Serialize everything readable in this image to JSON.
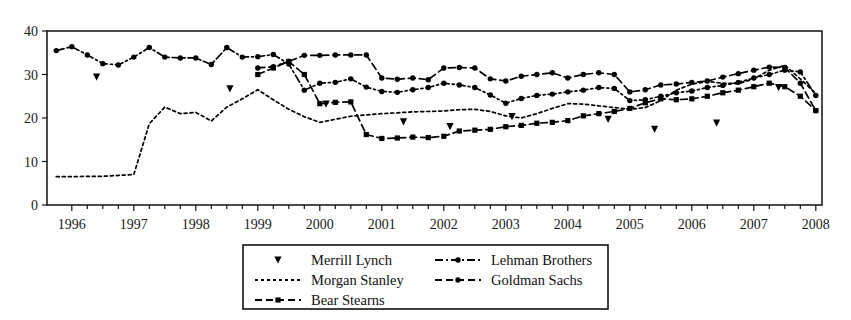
{
  "chart_data": {
    "type": "line",
    "title": "",
    "subtitle": "",
    "xlabel": "",
    "ylabel": "",
    "xlim": [
      1995.6,
      2008.1
    ],
    "ylim": [
      0,
      40
    ],
    "ytick_labels": [
      "0",
      "10",
      "20",
      "30",
      "40"
    ],
    "ytick_values": [
      0,
      10,
      20,
      30,
      40
    ],
    "xtick_labels": [
      "1996",
      "1997",
      "1998",
      "1999",
      "2000",
      "2001",
      "2002",
      "2003",
      "2004",
      "2005",
      "2006",
      "2007",
      "2008"
    ],
    "xtick_values": [
      1996,
      1997,
      1998,
      1999,
      2000,
      2001,
      2002,
      2003,
      2004,
      2005,
      2006,
      2007,
      2008
    ],
    "minor_xticks_per_year": 4,
    "grid": false,
    "legend_position": "below-center",
    "frame": true,
    "series": [
      {
        "name": "Merrill Lynch",
        "style": "markers-only",
        "marker": "triangle-down",
        "x": [
          1996.4,
          1998.55,
          2000.1,
          2001.35,
          2002.1,
          2003.1,
          2004.65,
          2005.4,
          2006.4,
          2007.4
        ],
        "values": [
          29.4,
          26.7,
          23.2,
          19.1,
          18.0,
          20.3,
          19.7,
          17.4,
          18.8,
          27.0
        ]
      },
      {
        "name": "Morgan Stanley",
        "style": "dotted",
        "marker": "none",
        "x": [
          1995.75,
          1996.0,
          1996.25,
          1996.5,
          1996.75,
          1997.0,
          1997.25,
          1997.5,
          1997.75,
          1998.0,
          1998.25,
          1998.5,
          1998.75,
          1999.0,
          1999.25,
          1999.5,
          1999.75,
          2000.0,
          2000.25,
          2000.5,
          2000.75,
          2001.0,
          2001.25,
          2001.5,
          2001.75,
          2002.0,
          2002.25,
          2002.5,
          2002.75,
          2003.0,
          2003.25,
          2003.5,
          2003.75,
          2004.0,
          2004.25,
          2004.5,
          2004.75,
          2005.0,
          2005.25,
          2005.5,
          2005.75,
          2006.0,
          2006.25,
          2006.5,
          2006.75,
          2007.0,
          2007.25,
          2007.5,
          2007.75,
          2008.0
        ],
        "values": [
          6.5,
          6.5,
          6.6,
          6.6,
          6.8,
          7.0,
          18.7,
          22.5,
          21.0,
          21.3,
          19.3,
          22.5,
          24.4,
          26.5,
          24.2,
          22.0,
          20.3,
          19.0,
          19.7,
          20.4,
          20.7,
          21.0,
          21.2,
          21.4,
          21.5,
          21.6,
          21.9,
          22.0,
          21.5,
          20.5,
          20.0,
          21.0,
          22.2,
          23.3,
          23.2,
          22.8,
          22.4,
          22.0,
          22.4,
          24.0,
          26.4,
          27.8,
          28.4,
          28.0,
          27.9,
          29.0,
          31.0,
          32.1,
          29.0,
          25.6
        ]
      },
      {
        "name": "Bear Stearns",
        "style": "dashed",
        "marker": "square",
        "x": [
          1999.0,
          1999.25,
          1999.5,
          1999.75,
          2000.0,
          2000.25,
          2000.5,
          2000.75,
          2001.0,
          2001.25,
          2001.5,
          2001.75,
          2002.0,
          2002.25,
          2002.5,
          2002.75,
          2003.0,
          2003.25,
          2003.5,
          2003.75,
          2004.0,
          2004.25,
          2004.5,
          2004.75,
          2005.0,
          2005.25,
          2005.5,
          2005.75,
          2006.0,
          2006.25,
          2006.5,
          2006.75,
          2007.0,
          2007.25,
          2007.5,
          2007.75,
          2008.0
        ],
        "values": [
          30.0,
          31.5,
          33.0,
          30.0,
          23.3,
          23.6,
          23.7,
          16.2,
          15.3,
          15.4,
          15.6,
          15.5,
          15.8,
          17.0,
          17.2,
          17.4,
          18.0,
          18.3,
          18.8,
          19.0,
          19.4,
          20.5,
          21.0,
          21.5,
          22.2,
          23.5,
          24.4,
          24.2,
          24.4,
          25.0,
          25.8,
          26.4,
          27.2,
          28.0,
          27.2,
          25.0,
          21.7
        ]
      },
      {
        "name": "Lehman Brothers",
        "style": "dash-dot",
        "marker": "circle",
        "x": [
          1995.75,
          1996.0,
          1996.25,
          1996.5,
          1996.75,
          1997.0,
          1997.25,
          1997.5,
          1997.75,
          1998.0,
          1998.25,
          1998.5,
          1998.75,
          1999.0,
          1999.25,
          1999.5,
          1999.75,
          2000.0,
          2000.25,
          2000.5,
          2000.75,
          2001.0,
          2001.25,
          2001.5,
          2001.75,
          2002.0,
          2002.25,
          2002.5,
          2002.75,
          2003.0,
          2003.25,
          2003.5,
          2003.75,
          2004.0,
          2004.25,
          2004.5,
          2004.75,
          2005.0,
          2005.25,
          2005.5,
          2005.75,
          2006.0,
          2006.25,
          2006.5,
          2006.75,
          2007.0,
          2007.25,
          2007.5,
          2007.75,
          2008.0
        ],
        "values": [
          35.5,
          36.4,
          34.5,
          32.5,
          32.2,
          34.0,
          36.2,
          34.0,
          33.8,
          33.8,
          32.3,
          36.2,
          34.0,
          34.1,
          34.6,
          32.4,
          26.4,
          28.0,
          28.2,
          29.0,
          27.1,
          26.1,
          25.9,
          26.5,
          27.0,
          28.0,
          27.6,
          27.0,
          25.3,
          23.4,
          24.5,
          25.2,
          25.5,
          26.0,
          26.4,
          27.0,
          26.8,
          24.0,
          24.2,
          25.0,
          25.8,
          26.2,
          27.0,
          27.5,
          28.2,
          29.2,
          30.0,
          31.0,
          30.6,
          25.2
        ]
      },
      {
        "name": "Goldman Sachs",
        "style": "dashed",
        "marker": "circle",
        "x": [
          1999.0,
          1999.25,
          1999.5,
          1999.75,
          2000.0,
          2000.25,
          2000.5,
          2000.75,
          2001.0,
          2001.25,
          2001.5,
          2001.75,
          2002.0,
          2002.25,
          2002.5,
          2002.75,
          2003.0,
          2003.25,
          2003.5,
          2003.75,
          2004.0,
          2004.25,
          2004.5,
          2004.75,
          2005.0,
          2005.25,
          2005.5,
          2005.75,
          2006.0,
          2006.25,
          2006.5,
          2006.75,
          2007.0,
          2007.25,
          2007.5,
          2007.75,
          2008.0
        ],
        "values": [
          31.5,
          31.8,
          33.0,
          34.4,
          34.4,
          34.5,
          34.5,
          34.5,
          29.2,
          28.9,
          29.2,
          28.8,
          31.5,
          31.6,
          31.5,
          29.0,
          28.5,
          29.6,
          30.0,
          30.4,
          29.2,
          30.0,
          30.4,
          30.0,
          26.0,
          26.5,
          27.6,
          27.8,
          28.2,
          28.5,
          29.4,
          30.2,
          31.0,
          31.7,
          31.6,
          28.0,
          21.7
        ]
      }
    ]
  },
  "legend": {
    "entries": [
      {
        "label": "Merrill Lynch"
      },
      {
        "label": "Lehman Brothers"
      },
      {
        "label": "Morgan Stanley"
      },
      {
        "label": "Goldman Sachs"
      },
      {
        "label": "Bear Stearns"
      }
    ]
  },
  "colors": {
    "line": "#000000",
    "axis": "#111111",
    "background": "#ffffff",
    "text": "#1a1a1a"
  }
}
